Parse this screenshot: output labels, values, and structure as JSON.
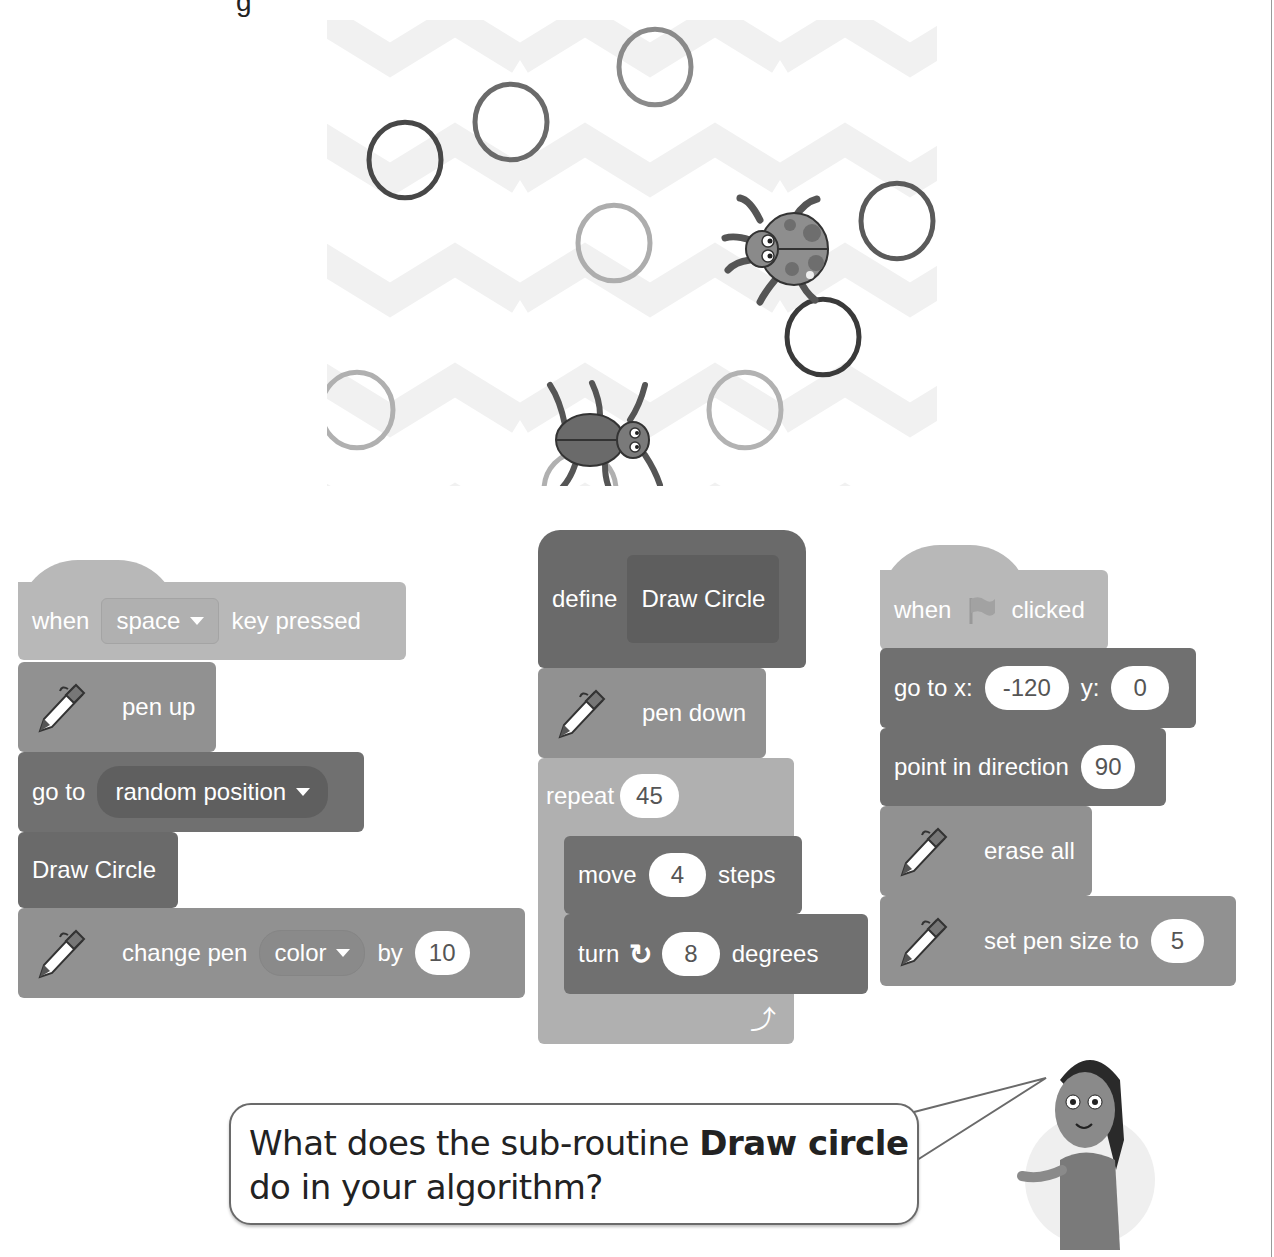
{
  "top_fragment": "g",
  "stage": {
    "sprites": [
      {
        "name": "ladybug",
        "x": 780,
        "y": 245
      },
      {
        "name": "beetle",
        "x": 605,
        "y": 440
      }
    ],
    "circles": [
      {
        "cx": 405,
        "cy": 160,
        "r": 36,
        "color": "#474747"
      },
      {
        "cx": 511,
        "cy": 122,
        "r": 36,
        "color": "#6a6a6a"
      },
      {
        "cx": 655,
        "cy": 67,
        "r": 36,
        "color": "#8a8a8a"
      },
      {
        "cx": 614,
        "cy": 243,
        "r": 36,
        "color": "#adadad"
      },
      {
        "cx": 897,
        "cy": 221,
        "r": 36,
        "color": "#5a5a5a"
      },
      {
        "cx": 823,
        "cy": 337,
        "r": 36,
        "color": "#3a3a3a"
      },
      {
        "cx": 745,
        "cy": 410,
        "r": 36,
        "color": "#b2b2b2"
      },
      {
        "cx": 357,
        "cy": 410,
        "r": 36,
        "color": "#b0b0b0"
      },
      {
        "cx": 580,
        "cy": 490,
        "r": 36,
        "color": "#b0b0b0"
      }
    ]
  },
  "script1": {
    "hat": {
      "when": "when",
      "key": "space",
      "rest": "key pressed"
    },
    "pen_up": "pen up",
    "goto": {
      "label": "go to",
      "target": "random position"
    },
    "draw_circle": "Draw Circle",
    "change_pen": {
      "label": "change pen",
      "param": "color",
      "by": "by",
      "value": "10"
    }
  },
  "script2": {
    "define": {
      "label": "define",
      "name": "Draw Circle"
    },
    "pen_down": "pen down",
    "repeat": {
      "label": "repeat",
      "value": "45"
    },
    "move": {
      "label": "move",
      "value": "4",
      "unit": "steps"
    },
    "turn": {
      "label": "turn",
      "value": "8",
      "unit": "degrees"
    }
  },
  "script3": {
    "hat": {
      "when": "when",
      "rest": "clicked"
    },
    "goto_xy": {
      "label": "go to x:",
      "x": "-120",
      "ylabel": "y:",
      "y": "0"
    },
    "point": {
      "label": "point in direction",
      "value": "90"
    },
    "erase": "erase all",
    "pen_size": {
      "label": "set pen size to",
      "value": "5"
    }
  },
  "speech": {
    "prefix": "What does the sub-routine ",
    "bold": "Draw circle",
    "suffix": "do in your algorithm?"
  },
  "colors": {
    "event": "#b8b8b8",
    "pen": "#919191",
    "motion": "#707070",
    "custom": "#6a6a6a",
    "control": "#b0b0b0"
  }
}
